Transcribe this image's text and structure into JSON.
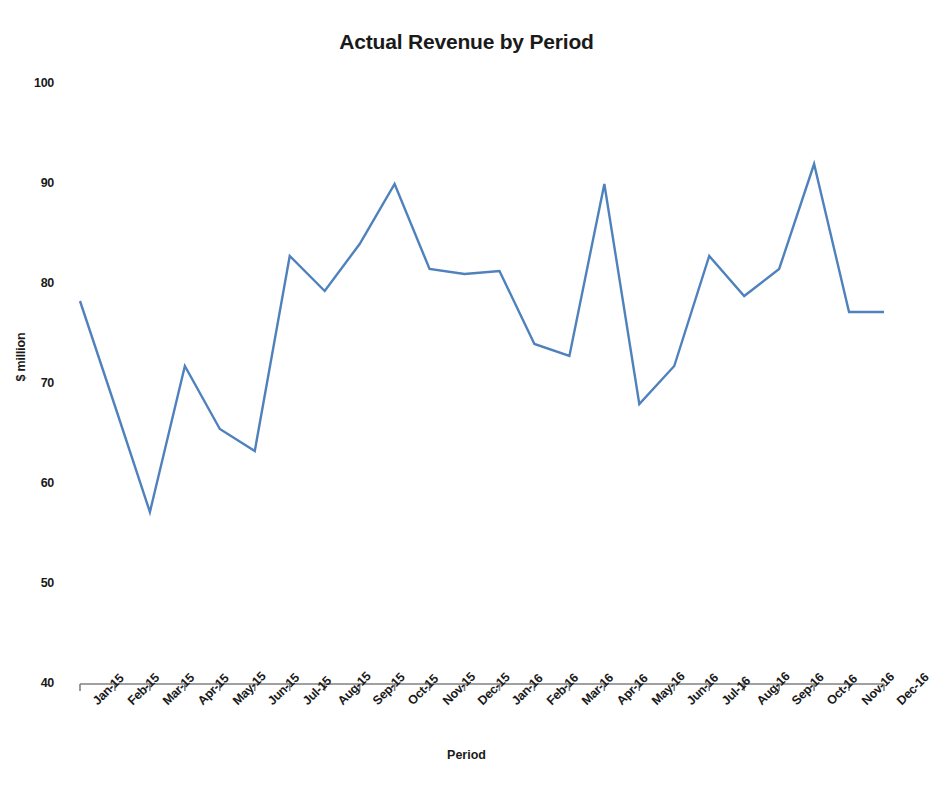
{
  "chart_data": {
    "type": "line",
    "title": "Actual Revenue by Period",
    "xlabel": "Period",
    "ylabel": "$ million",
    "grid": false,
    "legend": "none",
    "ylim": [
      40,
      100
    ],
    "ytick_step": 10,
    "ytick_labels": [
      "100",
      "90",
      "80",
      "70",
      "60",
      "50",
      "40"
    ],
    "categories": [
      "Jan-15",
      "Feb-15",
      "Mar-15",
      "Apr-15",
      "May-15",
      "Jun-15",
      "Jul-15",
      "Aug-15",
      "Sep-15",
      "Oct-15",
      "Nov-15",
      "Dec-15",
      "Jan-16",
      "Feb-16",
      "Mar-16",
      "Apr-16",
      "May-16",
      "Jun-16",
      "Jul-16",
      "Aug-16",
      "Sep-16",
      "Oct-16",
      "Nov-16",
      "Dec-16"
    ],
    "series": [
      {
        "name": "Actual Revenue",
        "color": "#4f81bd",
        "values": [
          78.3,
          67.8,
          57.2,
          71.8,
          65.5,
          63.3,
          82.8,
          79.3,
          84.0,
          90.0,
          81.5,
          81.0,
          81.3,
          74.0,
          72.8,
          90.0,
          68.0,
          71.8,
          82.8,
          78.8,
          81.5,
          92.0,
          77.2,
          77.2
        ]
      }
    ],
    "axis_color": "#808080",
    "line_width": 2.4
  }
}
